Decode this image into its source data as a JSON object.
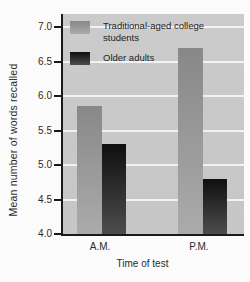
{
  "figure": {
    "background": "#fbfbfb",
    "plot_background": "#c9c9c9",
    "gridline_color": "#f2f2f2",
    "axis_color": "#1a1a1a",
    "text_color": "#2b2b2b"
  },
  "chart_data": {
    "type": "bar",
    "title": "",
    "categories": [
      "A.M.",
      "P.M."
    ],
    "series": [
      {
        "name": "Traditional-aged college students",
        "values": [
          5.85,
          6.7
        ],
        "color_top": "#888888",
        "color_bottom": "#ababab"
      },
      {
        "name": "Older adults",
        "values": [
          5.3,
          4.8
        ],
        "color_top": "#0f0f0f",
        "color_bottom": "#4d4d4d"
      }
    ],
    "xlabel": "Time of test",
    "ylabel": "Mean number of words recalled",
    "ylim": [
      4.0,
      7.0
    ],
    "ytick_labels": [
      "7.0",
      "6.5",
      "6.0",
      "5.5",
      "5.0",
      "4.5",
      "4.0"
    ],
    "grid": true,
    "legend_position": "top-left"
  }
}
